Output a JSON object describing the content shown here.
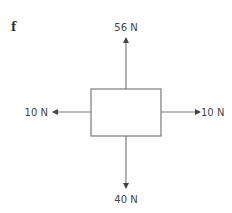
{
  "figure": {
    "part_label": "f",
    "colors": {
      "line": "#7a7a7a",
      "text": "#444444",
      "background": "#ffffff"
    },
    "body": {
      "shape": "rectangle"
    },
    "forces": {
      "up": {
        "label": "56 N",
        "magnitude": 56,
        "direction": "up"
      },
      "down": {
        "label": "40 N",
        "magnitude": 40,
        "direction": "down"
      },
      "left": {
        "label": "10 N",
        "magnitude": 10,
        "direction": "left"
      },
      "right": {
        "label": "10 N",
        "magnitude": 10,
        "direction": "right"
      }
    }
  }
}
